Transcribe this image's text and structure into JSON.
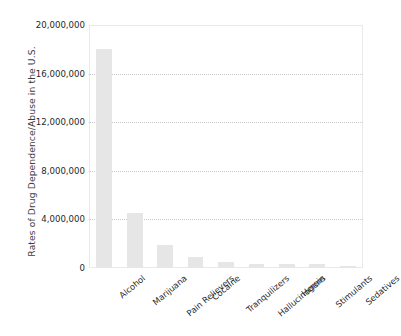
{
  "chart_data": {
    "type": "bar",
    "title": "",
    "xlabel": "",
    "ylabel": "Rates of Drug Dependence/Abuse in the U.S.",
    "categories": [
      "Alcohol",
      "Marijuana",
      "Pain Relievers",
      "Cocaine",
      "Tranquilizers",
      "Hallucinogens",
      "Heroin",
      "Stimulants",
      "Sedatives"
    ],
    "values": [
      18000000,
      4500000,
      1900000,
      900000,
      500000,
      350000,
      350000,
      330000,
      180000
    ],
    "ylim": [
      0,
      20000000
    ],
    "yticks": [
      0,
      4000000,
      8000000,
      12000000,
      16000000,
      20000000
    ],
    "ytick_labels": [
      "0",
      "4,000,000",
      "8,000,000",
      "12,000,000",
      "16,000,000",
      "20,000,000"
    ],
    "grid": true,
    "legend": false,
    "bar_color": "#e6e6e6",
    "grid_color": "#c9c9c9",
    "axis_text_color": "#1f1f1f",
    "background": "#ffffff"
  }
}
